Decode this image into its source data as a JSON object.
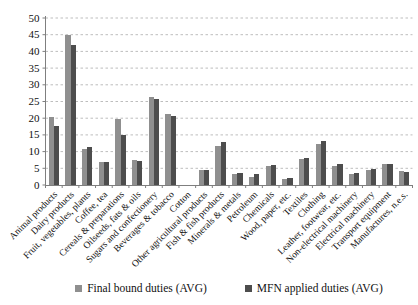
{
  "chart_data": {
    "type": "bar",
    "title": "",
    "xlabel": "",
    "ylabel": "",
    "ylim": [
      0,
      50
    ],
    "yticks": [
      0,
      5,
      10,
      15,
      20,
      25,
      30,
      35,
      40,
      45,
      50
    ],
    "grid": "horizontal-dashed",
    "grid_color": "#bdbdbd",
    "axis_color": "#7f7f7f",
    "legend_position": "bottom",
    "categories": [
      "Animal products",
      "Dairy products",
      "Fruit, vegetables, plants",
      "Coffee, tea",
      "Cereals & preparations",
      "Oilseeds, fats & oils",
      "Sugars and confectionery",
      "Beverages & tobacco",
      "Cotton",
      "Other agricultural products",
      "Fish & fish products",
      "Minerals & metals",
      "Petroleum",
      "Chemicals",
      "Wood, paper, etc.",
      "Textiles",
      "Clothing",
      "Leather, footwear, etc.",
      "Non-electrical machinery",
      "Electrical machinery",
      "Transport equipment",
      "Manufactures, n.e.s."
    ],
    "series": [
      {
        "name": "Final bound duties (AVG)",
        "color": "#8f8f8f",
        "values": [
          20.4,
          45.0,
          10.8,
          6.9,
          19.7,
          7.4,
          26.3,
          21.3,
          0,
          4.4,
          11.8,
          3.3,
          2.5,
          5.8,
          1.7,
          7.9,
          12.4,
          5.8,
          3.3,
          4.4,
          6.2,
          4.2
        ]
      },
      {
        "name": "MFN applied duties (AVG)",
        "color": "#4d4d4d",
        "values": [
          17.8,
          42.0,
          11.3,
          6.8,
          15.1,
          7.2,
          25.6,
          20.8,
          0,
          4.6,
          13.0,
          3.6,
          3.2,
          6.1,
          2.1,
          8.2,
          13.2,
          6.2,
          3.7,
          4.8,
          6.4,
          3.8
        ]
      }
    ]
  }
}
